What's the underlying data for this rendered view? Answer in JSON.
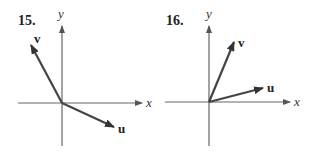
{
  "figures": [
    {
      "number": "15.",
      "x_label": "x",
      "y_label": "y",
      "vectors": [
        {
          "name": "v",
          "label": "v",
          "direction": "up-left"
        },
        {
          "name": "u",
          "label": "u",
          "direction": "down-right"
        }
      ]
    },
    {
      "number": "16.",
      "x_label": "x",
      "y_label": "y",
      "vectors": [
        {
          "name": "v",
          "label": "v",
          "direction": "up-right-steep"
        },
        {
          "name": "u",
          "label": "u",
          "direction": "up-right-shallow"
        }
      ]
    }
  ],
  "colors": {
    "axis": "#666666",
    "vector": "#444444",
    "text": "#222222"
  }
}
